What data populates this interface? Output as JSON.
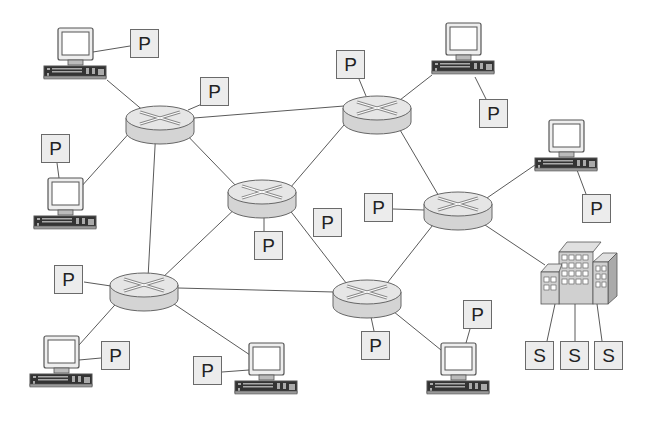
{
  "diagram": {
    "type": "network-topology",
    "colors": {
      "background": "#ffffff",
      "line": "#555555",
      "box_fill": "#ececec",
      "router_fill": "#d9d9d9"
    },
    "routers": [
      {
        "id": "R1",
        "x": 160,
        "y": 120
      },
      {
        "id": "R2",
        "x": 377,
        "y": 110
      },
      {
        "id": "R3",
        "x": 262,
        "y": 195
      },
      {
        "id": "R4",
        "x": 458,
        "y": 208
      },
      {
        "id": "R5",
        "x": 144,
        "y": 287
      },
      {
        "id": "R6",
        "x": 367,
        "y": 295
      }
    ],
    "computers": [
      {
        "id": "C1",
        "x": 44,
        "y": 28
      },
      {
        "id": "C2",
        "x": 432,
        "y": 23
      },
      {
        "id": "C3",
        "x": 535,
        "y": 120
      },
      {
        "id": "C4",
        "x": 34,
        "y": 178
      },
      {
        "id": "C5",
        "x": 30,
        "y": 336
      },
      {
        "id": "C6",
        "x": 235,
        "y": 343
      },
      {
        "id": "C7",
        "x": 427,
        "y": 343
      }
    ],
    "peer_labels": [
      {
        "text": "P",
        "x": 130,
        "y": 29
      },
      {
        "text": "P",
        "x": 200,
        "y": 77
      },
      {
        "text": "P",
        "x": 336,
        "y": 50
      },
      {
        "text": "P",
        "x": 479,
        "y": 99
      },
      {
        "text": "P",
        "x": 41,
        "y": 134
      },
      {
        "text": "P",
        "x": 582,
        "y": 194
      },
      {
        "text": "P",
        "x": 364,
        "y": 193
      },
      {
        "text": "P",
        "x": 313,
        "y": 208
      },
      {
        "text": "P",
        "x": 254,
        "y": 231
      },
      {
        "text": "P",
        "x": 54,
        "y": 265
      },
      {
        "text": "P",
        "x": 101,
        "y": 341
      },
      {
        "text": "P",
        "x": 193,
        "y": 356
      },
      {
        "text": "P",
        "x": 361,
        "y": 331
      },
      {
        "text": "P",
        "x": 463,
        "y": 300
      }
    ],
    "server_building": {
      "x": 540,
      "y": 240
    },
    "server_labels": [
      {
        "text": "S",
        "x": 525,
        "y": 341
      },
      {
        "text": "S",
        "x": 560,
        "y": 341
      },
      {
        "text": "S",
        "x": 594,
        "y": 341
      }
    ]
  }
}
